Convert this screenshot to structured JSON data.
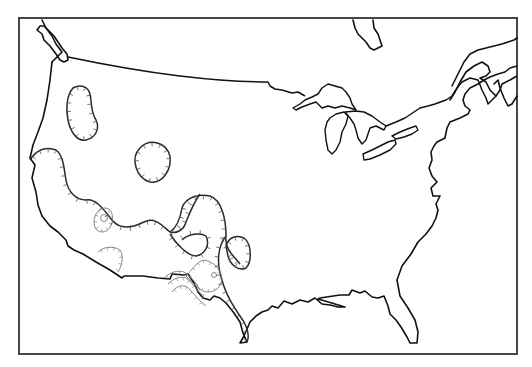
{
  "map": {
    "type": "line-art outline map",
    "region": "Contiguous United States with southern Canada",
    "colors": {
      "background": "#ffffff",
      "line": "#111111",
      "contour_thin": "#777777"
    },
    "features": [
      {
        "name": "map-frame"
      },
      {
        "name": "us-coastline-and-borders"
      },
      {
        "name": "us-canada-border"
      },
      {
        "name": "great-lakes"
      },
      {
        "name": "st-lawrence-region"
      },
      {
        "name": "hudson-bay-inlet"
      },
      {
        "name": "hachured-contours-west"
      },
      {
        "name": "hachured-contours-southwest"
      }
    ],
    "labels": []
  }
}
